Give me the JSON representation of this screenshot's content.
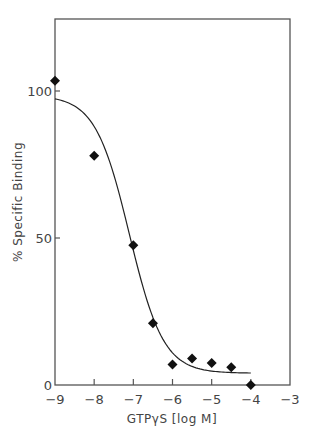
{
  "chart_data": {
    "type": "scatter",
    "title": "",
    "xlabel": "GTPγS [log M]",
    "ylabel": "% Specific Binding",
    "xlim": [
      -9,
      -3
    ],
    "ylim": [
      0,
      125
    ],
    "x_ticks": [
      -9,
      -8,
      -7,
      -6,
      -5,
      -4,
      -3
    ],
    "x_tick_labels": [
      "-9",
      "-8",
      "-7",
      "-6",
      "-5",
      "-4",
      "-3"
    ],
    "y_ticks": [
      0,
      50,
      100
    ],
    "y_tick_labels": [
      "0",
      "50",
      "100"
    ],
    "grid": false,
    "legend": null,
    "series": [
      {
        "name": "data",
        "marker": "diamond",
        "color": "#111111",
        "x": [
          -9,
          -8,
          -7,
          -6.5,
          -6,
          -5.5,
          -5,
          -4.5,
          -4
        ],
        "y": [
          103.5,
          78,
          47.5,
          21,
          7,
          9,
          7.5,
          6,
          0
        ]
      },
      {
        "name": "fit",
        "style": "line",
        "color": "#222222",
        "model": "sigmoid",
        "top": 98.5,
        "bottom": 4,
        "log_ic50": -7.1,
        "hill_slope": 1.0,
        "x_range": [
          -9,
          -4
        ]
      }
    ]
  }
}
